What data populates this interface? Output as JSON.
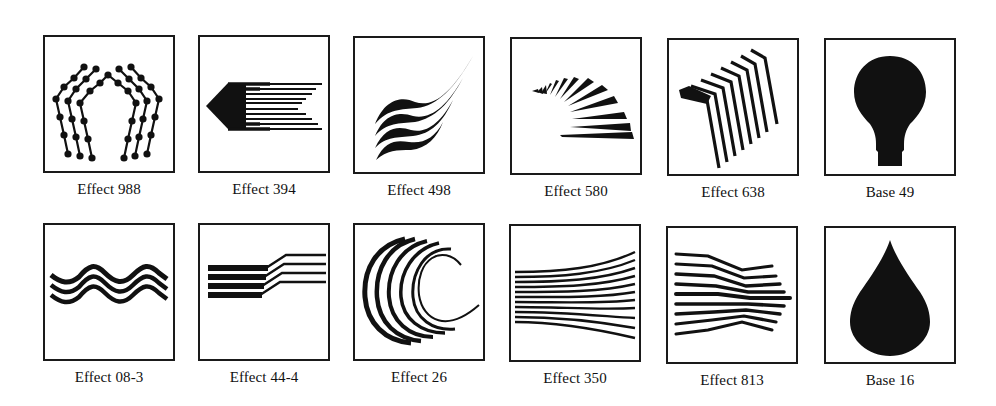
{
  "rows": [
    {
      "items": [
        {
          "label": "Effect 988",
          "icon": "beaded-pentagon-arches-icon"
        },
        {
          "label": "Effect 394",
          "icon": "arrow-speed-lines-icon"
        },
        {
          "label": "Effect 498",
          "icon": "flowing-wave-strands-icon"
        },
        {
          "label": "Effect 580",
          "icon": "fanning-rays-icon"
        },
        {
          "label": "Effect 638",
          "icon": "bent-staircase-lines-icon"
        },
        {
          "label": "Base 49",
          "icon": "light-bulb-icon"
        }
      ]
    },
    {
      "items": [
        {
          "label": "Effect 08-3",
          "icon": "triple-wave-icon"
        },
        {
          "label": "Effect 44-4",
          "icon": "stepped-bars-icon"
        },
        {
          "label": "Effect 26",
          "icon": "concentric-arcs-icon"
        },
        {
          "label": "Effect 350",
          "icon": "spreading-lines-icon"
        },
        {
          "label": "Effect 813",
          "icon": "pinched-lines-icon"
        },
        {
          "label": "Base 16",
          "icon": "water-drop-icon"
        }
      ]
    }
  ],
  "colors": {
    "ink": "#111111",
    "frame": "#1a1a1a",
    "background": "#ffffff"
  }
}
